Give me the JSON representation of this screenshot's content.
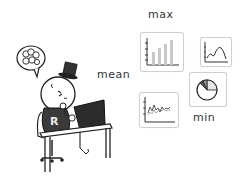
{
  "labels": {
    "max": "max",
    "mean": "mean",
    "min": "min"
  },
  "character": {
    "shirt_letter": "R",
    "accessories": [
      "top-hat",
      "thought-bubble",
      "laptop",
      "desk",
      "office-chair"
    ]
  },
  "cards": [
    {
      "name": "bar-chart-card",
      "type": "bar",
      "bars": [
        0.45,
        0.6,
        0.75,
        0.95
      ]
    },
    {
      "name": "line-chart-card-small",
      "type": "line"
    },
    {
      "name": "pie-chart-card",
      "type": "pie"
    },
    {
      "name": "line-chart-card-noisy",
      "type": "line"
    }
  ],
  "colors": {
    "stroke": "#222222",
    "card_border": "#cfcfcf",
    "bar_fill": "#c8c8c8",
    "label": "#333333"
  }
}
